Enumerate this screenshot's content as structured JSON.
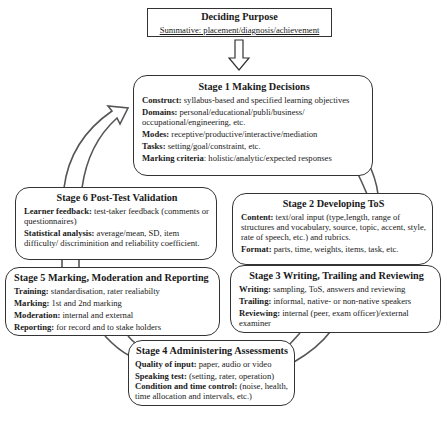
{
  "purpose": {
    "title": "Deciding Purpose",
    "subtitle": "Summative: placement/diagnosis/achievement"
  },
  "stages": [
    {
      "title": "Stage 1 Making Decisions",
      "items": [
        {
          "label": "Construct:",
          "text": " syllabus-based and specified learning objectives"
        },
        {
          "label": "Domains:",
          "text": " personal/educational/publi/business/ occupational/engineering, etc."
        },
        {
          "label": "Modes:",
          "text": " receptive/productive/interactive/mediation"
        },
        {
          "label": "Tasks:",
          "text": "  setting/goal/constraint, etc."
        },
        {
          "label": "Marking criteria",
          "text": ": holistic/analytic/expected responses"
        }
      ]
    },
    {
      "title": "Stage 2 Developing ToS",
      "items": [
        {
          "label": "Content:",
          "text": " text/oral input (type,length, range of structures and vocabulary, source, topic, accent, style, rate of speech, etc.) and rubrics."
        },
        {
          "label": "Format:",
          "text": " parts, time, weights, items, task, etc."
        }
      ]
    },
    {
      "title": "Stage 3 Writing, Trailing and Reviewing",
      "items": [
        {
          "label": "Writing:",
          "text": " sampling, ToS, answers and reviewing"
        },
        {
          "label": "Trailing:",
          "text": " informal, native- or non-native speakers"
        },
        {
          "label": "Reviewing:",
          "text": " internal (peer, exam officer)/external examiner"
        }
      ]
    },
    {
      "title": "Stage 4 Administering Assessments",
      "items": [
        {
          "label": "Quality of input:",
          "text": " paper, audio or video"
        },
        {
          "label": "Speaking test:",
          "text": " (setting, rater, operation)"
        },
        {
          "label": "Condition and time control:",
          "text": " (noise, health, time allocation and intervals, etc.)"
        }
      ]
    },
    {
      "title": "Stage 5 Marking, Moderation and Reporting",
      "items": [
        {
          "label": "Training:",
          "text": " standardisation, rater realiabilty"
        },
        {
          "label": "Marking:",
          "text": " 1st and 2nd marking"
        },
        {
          "label": "Moderation:",
          "text": " internal and external"
        },
        {
          "label": "Reporting:",
          "text": " for record and to stake holders"
        }
      ]
    },
    {
      "title": "Stage 6 Post-Test Validation",
      "items": [
        {
          "label": "Learner feedback:",
          "text": " test-taker feedback (comments or questionnaires)"
        },
        {
          "label": "Statistical  analysis:",
          "text": " average/mean, SD, item difficulty/ discriminition and reliability coefficient."
        }
      ]
    }
  ]
}
